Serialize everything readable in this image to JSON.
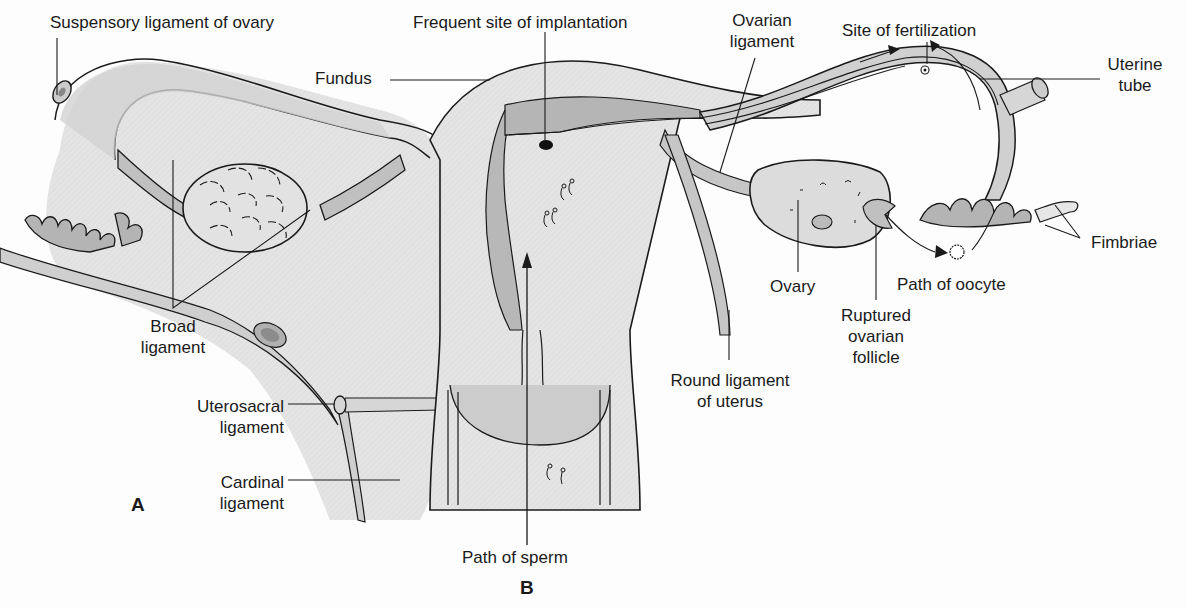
{
  "figure": {
    "type": "anatomical-diagram",
    "panels": [
      "A",
      "B"
    ],
    "colors": {
      "background": "#fdfdfd",
      "tissue_light": "#e6e6e6",
      "tissue_mid": "#c8c8c8",
      "tissue_dark": "#a9a9a9",
      "outline": "#1a1a1a"
    }
  },
  "labels": {
    "suspensory_ligament": "Suspensory ligament of ovary",
    "fundus": "Fundus",
    "implantation": "Frequent site of implantation",
    "ovarian_ligament_1": "Ovarian",
    "ovarian_ligament_2": "ligament",
    "fertilization": "Site of fertilization",
    "uterine_tube_1": "Uterine",
    "uterine_tube_2": "tube",
    "fimbriae": "Fimbriae",
    "ovary": "Ovary",
    "path_oocyte": "Path of oocyte",
    "ruptured_1": "Ruptured",
    "ruptured_2": "ovarian",
    "ruptured_3": "follicle",
    "round_lig_1": "Round ligament",
    "round_lig_2": "of uterus",
    "broad_1": "Broad",
    "broad_2": "ligament",
    "uterosacral_1": "Uterosacral",
    "uterosacral_2": "ligament",
    "cardinal_1": "Cardinal",
    "cardinal_2": "ligament",
    "path_sperm": "Path of sperm",
    "panel_a": "A",
    "panel_b": "B"
  }
}
